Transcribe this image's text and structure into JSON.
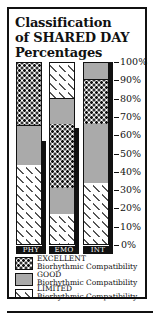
{
  "title_lines": [
    "Classification",
    "of SHARED DAY",
    "Percentages"
  ],
  "chart_data": {
    "type": "bar",
    "stacked": true,
    "title": "Classification of SHARED DAY Percentages",
    "categories": [
      "PHY",
      "EMO",
      "INT"
    ],
    "xlabel": "",
    "ylabel": "",
    "ylim": [
      0,
      100
    ],
    "yticks": [
      "0%",
      "10%",
      "20%",
      "30%",
      "40%",
      "50%",
      "60%",
      "70%",
      "80%",
      "90%",
      "100%"
    ],
    "bars": [
      {
        "category": "PHY",
        "segments_bottom_to_top": [
          {
            "class": "LIMITED",
            "from": 0,
            "to": 45
          },
          {
            "class": "GOOD",
            "from": 45,
            "to": 66
          },
          {
            "class": "EXCELLENT",
            "from": 66,
            "to": 100
          }
        ],
        "shadow_bar_top": 57
      },
      {
        "category": "EMO",
        "segments_bottom_to_top": [
          {
            "class": "LIMITED",
            "from": 0,
            "to": 18
          },
          {
            "class": "GOOD",
            "from": 18,
            "to": 32
          },
          {
            "class": "EXCELLENT",
            "from": 32,
            "to": 67
          },
          {
            "class": "GOOD",
            "from": 67,
            "to": 81
          },
          {
            "class": "LIMITED",
            "from": 81,
            "to": 100
          }
        ],
        "shadow_bar_top": 64
      },
      {
        "category": "INT",
        "segments_bottom_to_top": [
          {
            "class": "LIMITED",
            "from": 0,
            "to": 35
          },
          {
            "class": "GOOD",
            "from": 35,
            "to": 67
          },
          {
            "class": "EXCELLENT",
            "from": 67,
            "to": 91
          },
          {
            "class": "GOOD",
            "from": 91,
            "to": 100
          }
        ],
        "shadow_bar_top": 100
      }
    ],
    "legend": [
      {
        "name": "EXCELLENT",
        "description": "Biorhythmic Compatibility",
        "pattern": "dots"
      },
      {
        "name": "GOOD",
        "description": "Biorhythmic Compatibility",
        "pattern": "fine-gray"
      },
      {
        "name": "LIMITED",
        "description": "Biorhythmic Compatibility",
        "pattern": "diagonal-dashes"
      }
    ],
    "legend_position": "bottom",
    "grid": false
  },
  "legend": [
    {
      "label": "EXCELLENT",
      "sub": "Biorhythmic Compatibility"
    },
    {
      "label": "GOOD",
      "sub": "Biorhythmic Compatibility"
    },
    {
      "label": "LIMITED",
      "sub": "Biorhythmic Compatibility"
    }
  ],
  "colors": {
    "ink": "#111111",
    "good_fill": "#c8c8c8",
    "background": "#ffffff"
  }
}
